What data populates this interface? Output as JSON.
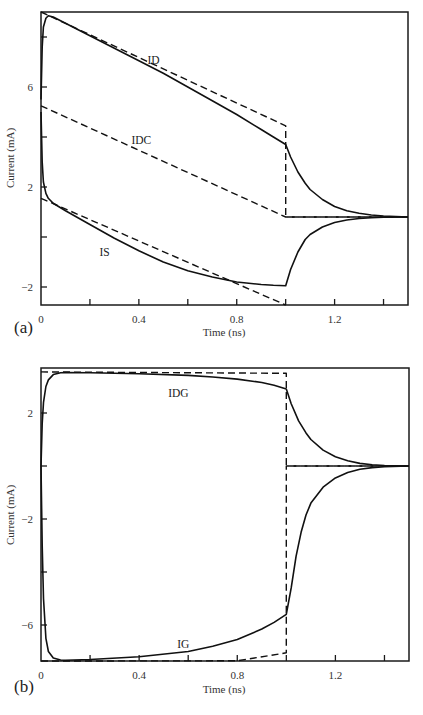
{
  "chart_data": [
    {
      "panel": "(a)",
      "type": "line",
      "title": "",
      "xlabel": "Time (ns)",
      "ylabel": "Current (mA)",
      "xlim": [
        0,
        1.5
      ],
      "ylim": [
        -2.7,
        9.5
      ],
      "xticks": [
        0,
        0.2,
        0.4,
        0.6,
        0.8,
        1.0,
        1.2,
        1.4
      ],
      "xtick_labels": [
        "0",
        "0.4",
        "0.8",
        "1.2"
      ],
      "xtick_label_values": [
        0,
        0.4,
        0.8,
        1.2
      ],
      "yticks": [
        -2,
        0,
        2,
        4,
        6,
        8
      ],
      "ytick_labels": [
        "-2",
        "2",
        "6"
      ],
      "ytick_label_values": [
        -2,
        2,
        6
      ],
      "grid": false,
      "annotations": [
        {
          "text": "ID",
          "x": 0.46,
          "y": 7.1
        },
        {
          "text": "IDC",
          "x": 0.41,
          "y": 3.9
        },
        {
          "text": "IS",
          "x": 0.26,
          "y": -0.6
        }
      ],
      "series": [
        {
          "name": "ID",
          "style": "solid",
          "x": [
            0,
            0.005,
            0.01,
            0.02,
            0.03,
            0.05,
            0.1,
            0.2,
            0.3,
            0.4,
            0.5,
            0.6,
            0.7,
            0.8,
            0.9,
            0.95,
            1.0,
            1.02,
            1.05,
            1.08,
            1.1,
            1.15,
            1.2,
            1.25,
            1.3,
            1.35,
            1.4,
            1.5
          ],
          "y": [
            5.5,
            7.6,
            8.4,
            8.75,
            8.85,
            8.8,
            8.55,
            8.05,
            7.55,
            7.05,
            6.55,
            6.0,
            5.45,
            4.9,
            4.3,
            4.0,
            3.7,
            3.2,
            2.6,
            2.15,
            1.9,
            1.5,
            1.22,
            1.05,
            0.95,
            0.88,
            0.84,
            0.8
          ]
        },
        {
          "name": "ID (ideal)",
          "style": "dashed",
          "x": [
            0,
            1.0,
            1.0,
            1.5
          ],
          "y": [
            9.1,
            4.45,
            0.8,
            0.8
          ]
        },
        {
          "name": "IDC",
          "style": "dashed",
          "x": [
            0,
            1.0,
            1.5
          ],
          "y": [
            5.25,
            0.8,
            0.8
          ]
        },
        {
          "name": "IS",
          "style": "solid",
          "x": [
            0,
            0.005,
            0.01,
            0.02,
            0.03,
            0.05,
            0.1,
            0.2,
            0.3,
            0.4,
            0.5,
            0.6,
            0.7,
            0.8,
            0.9,
            0.95,
            1.0,
            1.0,
            1.02,
            1.05,
            1.08,
            1.1,
            1.15,
            1.2,
            1.25,
            1.3,
            1.35,
            1.4,
            1.5
          ],
          "y": [
            5.0,
            3.0,
            2.2,
            1.75,
            1.55,
            1.35,
            1.05,
            0.5,
            -0.05,
            -0.55,
            -1.0,
            -1.35,
            -1.6,
            -1.8,
            -1.9,
            -1.93,
            -1.95,
            -1.95,
            -1.3,
            -0.6,
            -0.1,
            0.1,
            0.4,
            0.58,
            0.68,
            0.74,
            0.77,
            0.79,
            0.8
          ]
        },
        {
          "name": "IS (ideal)",
          "style": "dashed",
          "x": [
            0,
            1.0
          ],
          "y": [
            1.55,
            -2.9
          ]
        }
      ]
    },
    {
      "panel": "(b)",
      "type": "line",
      "title": "",
      "xlabel": "Time (ns)",
      "ylabel": "Current (mA)",
      "xlim": [
        0,
        1.5
      ],
      "ylim": [
        -7.4,
        3.7
      ],
      "xticks": [
        0,
        0.2,
        0.4,
        0.6,
        0.8,
        1.0,
        1.2,
        1.4
      ],
      "xtick_labels": [
        "0",
        "0.4",
        "0.8",
        "1.2"
      ],
      "xtick_label_values": [
        0,
        0.4,
        0.8,
        1.2
      ],
      "yticks": [
        -6,
        -4,
        -2,
        0,
        2
      ],
      "ytick_labels": [
        "-6",
        "-2",
        "2"
      ],
      "ytick_label_values": [
        -6,
        -2,
        2
      ],
      "grid": false,
      "annotations": [
        {
          "text": "IDG",
          "x": 0.56,
          "y": 2.75
        },
        {
          "text": "IG",
          "x": 0.58,
          "y": -6.7
        }
      ],
      "series": [
        {
          "name": "IDG",
          "style": "solid",
          "x": [
            0,
            0.005,
            0.01,
            0.02,
            0.03,
            0.05,
            0.08,
            0.1,
            0.2,
            0.4,
            0.6,
            0.7,
            0.8,
            0.9,
            0.95,
            1.0,
            1.02,
            1.05,
            1.08,
            1.1,
            1.15,
            1.2,
            1.25,
            1.3,
            1.35,
            1.4,
            1.5
          ],
          "y": [
            0,
            1.6,
            2.4,
            3.0,
            3.25,
            3.45,
            3.52,
            3.53,
            3.52,
            3.48,
            3.42,
            3.36,
            3.28,
            3.15,
            3.05,
            2.9,
            2.35,
            1.7,
            1.25,
            1.0,
            0.6,
            0.35,
            0.2,
            0.1,
            0.05,
            0.02,
            0
          ]
        },
        {
          "name": "IDG (ideal)",
          "style": "dashed",
          "x": [
            0,
            1.0,
            1.0,
            1.5
          ],
          "y": [
            3.55,
            3.5,
            0,
            0
          ]
        },
        {
          "name": "IG",
          "style": "solid",
          "x": [
            0,
            0.005,
            0.01,
            0.02,
            0.03,
            0.05,
            0.08,
            0.1,
            0.2,
            0.4,
            0.6,
            0.7,
            0.8,
            0.9,
            0.95,
            1.0,
            1.02,
            1.04,
            1.06,
            1.08,
            1.1,
            1.15,
            1.2,
            1.25,
            1.3,
            1.35,
            1.4,
            1.5
          ],
          "y": [
            0,
            -3.0,
            -5.0,
            -6.5,
            -7.0,
            -7.25,
            -7.32,
            -7.33,
            -7.3,
            -7.2,
            -7.0,
            -6.8,
            -6.55,
            -6.15,
            -5.9,
            -5.6,
            -4.6,
            -3.4,
            -2.5,
            -1.85,
            -1.4,
            -0.8,
            -0.45,
            -0.25,
            -0.12,
            -0.06,
            -0.03,
            0
          ]
        },
        {
          "name": "IG (ideal)",
          "style": "dashed",
          "x": [
            0,
            0.8,
            1.0,
            1.0,
            1.5
          ],
          "y": [
            -7.4,
            -7.35,
            -7.05,
            0,
            0
          ]
        }
      ]
    }
  ],
  "figure": {
    "panel_a_label": "(a)",
    "panel_b_label": "(b)",
    "xlabel": "Time (ns)",
    "ylabel": "Current (mA)"
  }
}
